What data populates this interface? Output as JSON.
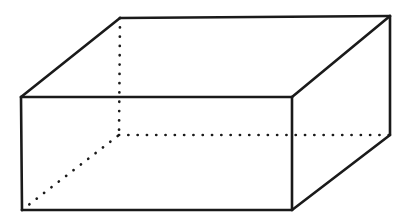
{
  "figure": {
    "shape_name": "rectangular-prism",
    "canvas": {
      "width": 413,
      "height": 224
    },
    "colors": {
      "background": "#ffffff",
      "edge_stroke": "#1a1a1a",
      "face_fill": "#ffffff"
    },
    "stroke": {
      "solid_width": 2.6,
      "hidden_width": 2.7,
      "hidden_style": "dotted"
    },
    "vertices": {
      "front_top_left": {
        "x": 21,
        "y": 97
      },
      "front_top_right": {
        "x": 292,
        "y": 97
      },
      "front_bottom_right": {
        "x": 292,
        "y": 210
      },
      "front_bottom_left": {
        "x": 22,
        "y": 210
      },
      "back_top_left": {
        "x": 120,
        "y": 18
      },
      "back_top_right": {
        "x": 390,
        "y": 16
      },
      "back_bottom_right": {
        "x": 390,
        "y": 135
      },
      "back_bottom_left": {
        "x": 119,
        "y": 135
      }
    },
    "edges": {
      "solid": [
        {
          "name": "front-top-edge",
          "from": "front_top_left",
          "to": "front_top_right"
        },
        {
          "name": "front-right-edge",
          "from": "front_top_right",
          "to": "front_bottom_right"
        },
        {
          "name": "front-bottom-edge",
          "from": "front_bottom_right",
          "to": "front_bottom_left"
        },
        {
          "name": "front-left-edge",
          "from": "front_bottom_left",
          "to": "front_top_left"
        },
        {
          "name": "top-left-receding-edge",
          "from": "front_top_left",
          "to": "back_top_left"
        },
        {
          "name": "top-back-edge",
          "from": "back_top_left",
          "to": "back_top_right"
        },
        {
          "name": "top-right-receding-edge",
          "from": "back_top_right",
          "to": "front_top_right"
        },
        {
          "name": "back-right-vertical-edge",
          "from": "back_top_right",
          "to": "back_bottom_right"
        },
        {
          "name": "bottom-right-receding-edge",
          "from": "back_bottom_right",
          "to": "front_bottom_right"
        }
      ],
      "hidden": [
        {
          "name": "hidden-back-left-vertical-edge",
          "from": "back_top_left",
          "to": "back_bottom_left"
        },
        {
          "name": "hidden-bottom-back-edge",
          "from": "back_bottom_left",
          "to": "back_bottom_right"
        },
        {
          "name": "hidden-bottom-left-receding-edge",
          "from": "front_bottom_left",
          "to": "back_bottom_left"
        }
      ]
    },
    "faces": [
      {
        "name": "front-face",
        "points": "21,97 292,97 292,210 22,210"
      },
      {
        "name": "top-face",
        "points": "21,97 120,18 390,16 292,97"
      },
      {
        "name": "right-face",
        "points": "292,97 390,16 390,135 292,210"
      }
    ]
  }
}
